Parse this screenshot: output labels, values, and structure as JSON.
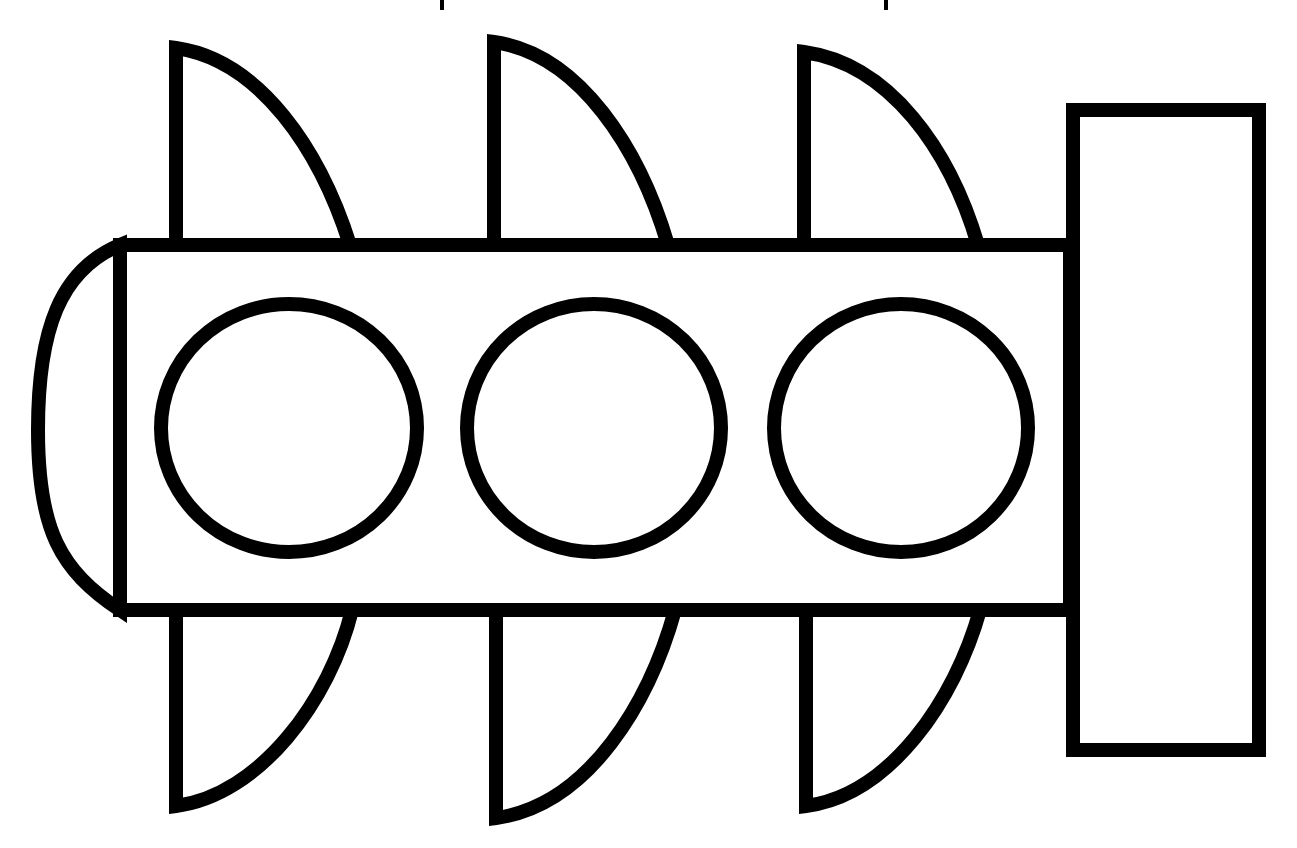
{
  "diagram": {
    "title": "",
    "colors": {
      "stroke": "#000000",
      "fill": "#ffffff",
      "background": "#ffffff"
    },
    "stroke_width": 14,
    "body": {
      "x": 120,
      "y": 245,
      "width": 950,
      "height": 365
    },
    "left_cap": {
      "type": "rounded-half-shape",
      "attached_to": "body-left-edge"
    },
    "right_block": {
      "x": 1073,
      "y": 110,
      "width": 186,
      "height": 640
    },
    "circles": [
      {
        "id": "circle-1",
        "cx": 289,
        "cy": 428,
        "rx": 128,
        "ry": 124
      },
      {
        "id": "circle-2",
        "cx": 594,
        "cy": 428,
        "rx": 127,
        "ry": 124
      },
      {
        "id": "circle-3",
        "cx": 901,
        "cy": 428,
        "rx": 127,
        "ry": 124
      }
    ],
    "top_fins": [
      {
        "id": "top-fin-1",
        "x": 176,
        "base_right": 350,
        "tip_y": 45
      },
      {
        "id": "top-fin-2",
        "x": 494,
        "base_right": 668,
        "tip_y": 38
      },
      {
        "id": "top-fin-3",
        "x": 804,
        "base_right": 978,
        "tip_y": 48
      }
    ],
    "bottom_fins": [
      {
        "id": "bottom-fin-1",
        "x": 176,
        "base_right": 350,
        "tip_y": 806
      },
      {
        "id": "bottom-fin-2",
        "x": 496,
        "base_right": 672,
        "tip_y": 820
      },
      {
        "id": "bottom-fin-3",
        "x": 806,
        "base_right": 980,
        "tip_y": 806
      }
    ],
    "labels": []
  }
}
